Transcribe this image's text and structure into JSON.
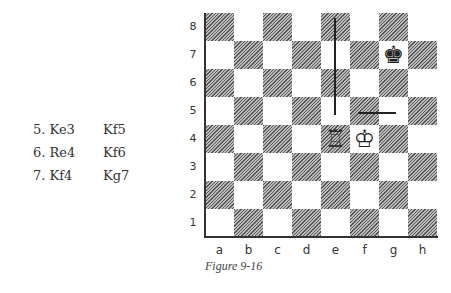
{
  "moves": [
    {
      "white": "5. Ke3",
      "black": "Kf5"
    },
    {
      "white": "6. Re4",
      "black": "Kf6"
    },
    {
      "white": "7. Kf4",
      "black": "Kg7"
    }
  ],
  "board": {
    "ranks": [
      "8",
      "7",
      "6",
      "5",
      "4",
      "3",
      "2",
      "1"
    ],
    "files": [
      "a",
      "b",
      "c",
      "d",
      "e",
      "f",
      "g",
      "h"
    ],
    "pieces": [
      {
        "square": "e4",
        "piece": "white-rook",
        "glyph": "♖"
      },
      {
        "square": "f4",
        "piece": "white-king",
        "glyph": "♔"
      },
      {
        "square": "g7",
        "piece": "black-king",
        "glyph": "♚"
      }
    ],
    "lines": [
      {
        "type": "vertical",
        "file": "e",
        "from": "e8",
        "to": "e5"
      },
      {
        "type": "horizontal",
        "rank": "5",
        "from": "f5",
        "to": "g5"
      }
    ]
  },
  "caption": "Figure 9-16"
}
